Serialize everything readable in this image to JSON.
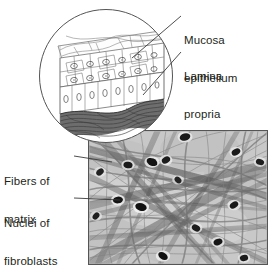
{
  "figure": {
    "name": "mucosa-histology-diagram",
    "background_color": "#ffffff",
    "ink_color": "#231f20",
    "labels": [
      {
        "id": "mucosa-epithelium",
        "line1": "Mucosa",
        "line2": "epithelium"
      },
      {
        "id": "lamina-propria",
        "line1": "Lamina",
        "line2": "propria"
      },
      {
        "id": "fibers-of-matrix",
        "line1": "Fibers of",
        "line2": "matrix"
      },
      {
        "id": "nuclei-of-fibroblasts",
        "line1": "Nuclei of",
        "line2": "fibroblasts"
      }
    ],
    "inset": {
      "name": "circular-inset-epithelium",
      "shape": "circle",
      "center_x": 106,
      "center_y": 76,
      "radius": 67,
      "layers": [
        "squamous-surface-cells",
        "polygonal-cells-with-nuclei",
        "columnar-basal-cells",
        "lamina-propria-fiber-band"
      ]
    },
    "micrograph": {
      "name": "connective-tissue-micrograph",
      "x": 88,
      "y": 130,
      "width": 180,
      "height": 135,
      "content": "crossing collagen fiber bundles with dark elliptical fibroblast nuclei",
      "fill": "#c9c9c9",
      "border": "#4a4a4a"
    },
    "leader_lines": [
      {
        "from": "mucosa-epithelium",
        "to": "epithelial-cell-layer"
      },
      {
        "from": "lamina-propria",
        "to": "fiber-band"
      },
      {
        "from": "fibers-of-matrix",
        "to": "fiber-bundle"
      },
      {
        "from": "nuclei-of-fibroblasts",
        "to": "nucleus"
      }
    ]
  }
}
